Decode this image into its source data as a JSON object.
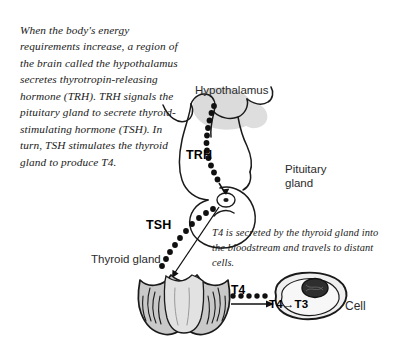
{
  "figure": {
    "background_color": "#ffffff"
  },
  "narrative": {
    "intro": "When the body's energy requirements increase, a region of the brain called the hypothalamus secretes thyrotropin-releasing hormone (TRH). TRH signals the pituitary gland to secrete thyroid-stimulating hormone (TSH). In turn, TSH stimulates the thyroid gland to produce T4.",
    "t4_note": "T4 is secreted by the thyroid gland into the bloodstream and travels to distant cells."
  },
  "anatomy_labels": {
    "hypothalamus": "Hypothalamus",
    "pituitary_gland": "Pituitary\ngland",
    "thyroid_gland": "Thyroid gland",
    "cell": "Cell"
  },
  "hormone_labels": {
    "trh": "TRH",
    "tsh": "TSH",
    "t4": "T4",
    "t4_to_t3": "T4→T3"
  },
  "colors": {
    "outline": "#1a1a1a",
    "hypothalamus_shading": "#d9d9d9",
    "organ_fill": "#c9c9c9",
    "organ_fill_light": "#e2e2e2",
    "nucleus": "#2e2e2e",
    "text": "#1a1a1a",
    "label_text": "#2b2b2b"
  },
  "pathways": [
    {
      "name": "trh-pathway",
      "from": "hypothalamus",
      "to": "pituitary_gland",
      "hormone": "TRH",
      "style": "dotted-arrow"
    },
    {
      "name": "tsh-pathway",
      "from": "pituitary_gland",
      "to": "thyroid_gland",
      "hormone": "TSH",
      "style": "dotted-arrow"
    },
    {
      "name": "t4-pathway",
      "from": "thyroid_gland",
      "to": "cell",
      "hormone": "T4",
      "style": "dotted-solid-arrow"
    }
  ]
}
